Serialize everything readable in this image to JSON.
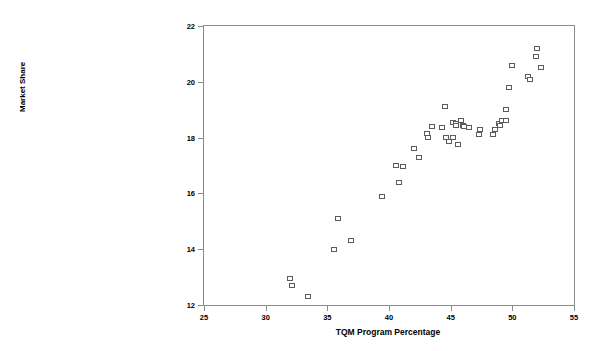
{
  "chart_data": {
    "type": "scatter",
    "title": "",
    "xlabel": "TQM Program Percentage",
    "ylabel": "Market Share",
    "xlim": [
      25,
      55
    ],
    "ylim": [
      12,
      22
    ],
    "xticks": [
      25,
      30,
      35,
      40,
      45,
      50,
      55
    ],
    "yticks": [
      12,
      14,
      16,
      18,
      20,
      22
    ],
    "grid": false,
    "legend": null,
    "marker": "open-square",
    "marker_color": "#5b5b5b",
    "frame_color": "#8a8a8a",
    "points": [
      {
        "x": 32.0,
        "y": 12.95
      },
      {
        "x": 32.1,
        "y": 12.7
      },
      {
        "x": 33.4,
        "y": 12.3
      },
      {
        "x": 35.5,
        "y": 14.0
      },
      {
        "x": 36.9,
        "y": 14.3
      },
      {
        "x": 35.9,
        "y": 15.1
      },
      {
        "x": 39.4,
        "y": 15.9
      },
      {
        "x": 40.8,
        "y": 16.4
      },
      {
        "x": 40.6,
        "y": 17.0
      },
      {
        "x": 41.1,
        "y": 16.95
      },
      {
        "x": 42.4,
        "y": 17.3
      },
      {
        "x": 42.0,
        "y": 17.6
      },
      {
        "x": 43.2,
        "y": 18.0
      },
      {
        "x": 43.1,
        "y": 18.15
      },
      {
        "x": 43.5,
        "y": 18.4
      },
      {
        "x": 44.3,
        "y": 18.35
      },
      {
        "x": 44.5,
        "y": 19.1
      },
      {
        "x": 44.6,
        "y": 18.0
      },
      {
        "x": 44.9,
        "y": 17.85
      },
      {
        "x": 45.2,
        "y": 18.55
      },
      {
        "x": 45.4,
        "y": 18.5
      },
      {
        "x": 45.8,
        "y": 18.6
      },
      {
        "x": 45.2,
        "y": 18.0
      },
      {
        "x": 45.4,
        "y": 18.45
      },
      {
        "x": 45.6,
        "y": 17.75
      },
      {
        "x": 46.0,
        "y": 18.45
      },
      {
        "x": 46.1,
        "y": 18.4
      },
      {
        "x": 46.5,
        "y": 18.35
      },
      {
        "x": 47.4,
        "y": 18.3
      },
      {
        "x": 47.3,
        "y": 18.1
      },
      {
        "x": 48.4,
        "y": 18.1
      },
      {
        "x": 48.6,
        "y": 18.3
      },
      {
        "x": 48.9,
        "y": 18.5
      },
      {
        "x": 49.0,
        "y": 18.45
      },
      {
        "x": 49.2,
        "y": 18.6
      },
      {
        "x": 49.5,
        "y": 18.6
      },
      {
        "x": 49.5,
        "y": 19.0
      },
      {
        "x": 49.7,
        "y": 19.8
      },
      {
        "x": 50.0,
        "y": 20.6
      },
      {
        "x": 51.3,
        "y": 20.2
      },
      {
        "x": 51.4,
        "y": 20.1
      },
      {
        "x": 52.0,
        "y": 21.2
      },
      {
        "x": 51.9,
        "y": 20.9
      },
      {
        "x": 52.3,
        "y": 20.5
      }
    ]
  }
}
